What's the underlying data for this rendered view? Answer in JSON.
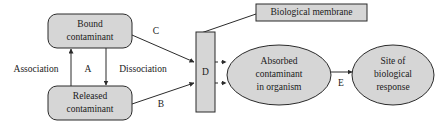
{
  "diagram": {
    "colors": {
      "shape_fill": "#d6d6d6",
      "stroke": "#2b2b2b",
      "background": "#ffffff",
      "text": "#1a1a1a"
    },
    "nodes": [
      {
        "id": "bound-contaminant",
        "shape": "rounded-rect",
        "line1": "Bound",
        "line2": "contaminant"
      },
      {
        "id": "released-contaminant",
        "shape": "rounded-rect",
        "line1": "Released",
        "line2": "contaminant"
      },
      {
        "id": "membrane-bar",
        "shape": "rect",
        "label": "D"
      },
      {
        "id": "biological-membrane-label",
        "shape": "rect-label",
        "label": "Biological membrane"
      },
      {
        "id": "absorbed-contaminant",
        "shape": "ellipse",
        "line1": "Absorbed",
        "line2": "contaminant",
        "line3": "in organism"
      },
      {
        "id": "site-of-response",
        "shape": "ellipse",
        "line1": "Site of",
        "line2": "biological",
        "line3": "response"
      }
    ],
    "edge_labels": {
      "association": "Association",
      "dissociation": "Dissociation",
      "a": "A",
      "b": "B",
      "c": "C",
      "d": "D",
      "e": "E"
    }
  }
}
